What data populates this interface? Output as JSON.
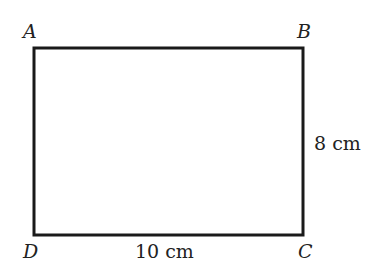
{
  "diagram": {
    "shape": "rectangle",
    "vertices": {
      "A": "A",
      "B": "B",
      "C": "C",
      "D": "D"
    },
    "dimensions": {
      "height": "8 cm",
      "width": "10 cm"
    },
    "stroke_color": "#1a1a1a"
  }
}
